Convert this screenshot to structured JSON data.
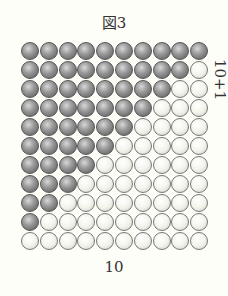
{
  "figure": {
    "title": "図3",
    "side_label": "10+1",
    "bottom_label": "10",
    "grid": {
      "rows": 11,
      "columns": 10,
      "dark_counts_per_row": [
        10,
        9,
        8,
        7,
        6,
        5,
        4,
        3,
        2,
        1,
        0
      ]
    },
    "colors": {
      "background": "#fefef8",
      "dark_ball": "#8a8a8a",
      "light_ball": "#f4f4ec"
    }
  }
}
